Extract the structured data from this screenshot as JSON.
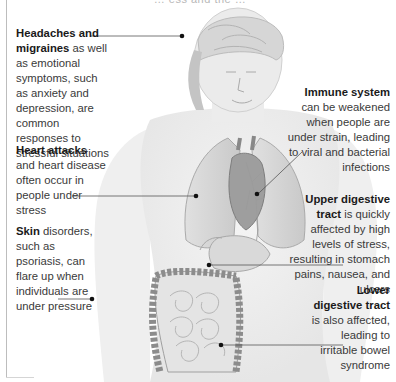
{
  "figure": {
    "top_caption": "… ess and the …",
    "background": "#ffffff",
    "text_color": "#3a3a3a",
    "bold_color": "#1a1a1a",
    "leader_line_color": "#555555",
    "dot_color": "#111111"
  },
  "annotations": {
    "headaches": {
      "bold": "Headaches and migraines",
      "text": " as well as emotional symptoms, such as anxiety and depression, are common responses to stressful situations",
      "side": "left"
    },
    "heart": {
      "bold": "Heart attacks",
      "text": " and heart disease often occur in people under stress",
      "side": "left"
    },
    "skin": {
      "bold": "Skin",
      "text": " disorders, such as psoriasis, can flare up when individuals are under pressure",
      "side": "left"
    },
    "immune": {
      "bold": "Immune system",
      "text": " can be weakened when people are under strain, leading to viral and bacterial infections",
      "side": "right"
    },
    "upper_digestive": {
      "bold": "Upper digestive tract",
      "text": " is quickly affected by high levels of stress, resulting in stomach pains, nausea, and ulcers",
      "side": "right"
    },
    "lower_digestive": {
      "bold": "Lower digestive tract",
      "text": " is also affected, leading to irritable bowel syndrome",
      "side": "right"
    }
  }
}
